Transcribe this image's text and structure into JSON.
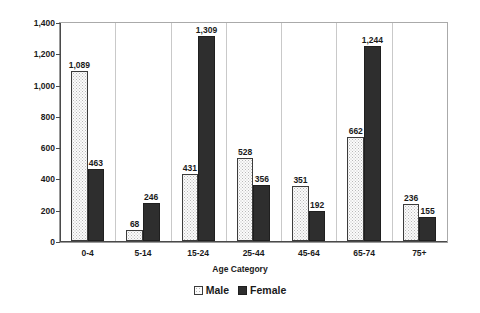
{
  "chart_data": {
    "type": "bar",
    "title": "",
    "xlabel": "Age Category",
    "ylabel": "Rate (per 100,000)",
    "categories": [
      "0-4",
      "5-14",
      "15-24",
      "25-44",
      "45-64",
      "65-74",
      "75+"
    ],
    "series": [
      {
        "name": "Male",
        "values": [
          1089,
          68,
          431,
          528,
          351,
          662,
          236
        ]
      },
      {
        "name": "Female",
        "values": [
          463,
          246,
          1309,
          356,
          192,
          1244,
          155
        ]
      }
    ],
    "value_labels": {
      "Male": [
        "1,089",
        "68",
        "431",
        "528",
        "351",
        "662",
        "236"
      ],
      "Female": [
        "463",
        "246",
        "1,309",
        "356",
        "192",
        "1,244",
        "155"
      ]
    },
    "ylim": [
      0,
      1400
    ],
    "yticks": [
      0,
      200,
      400,
      600,
      800,
      1000,
      1200,
      1400
    ],
    "ytick_labels": [
      "0",
      "200",
      "400",
      "600",
      "800",
      "1,000",
      "1,200",
      "1,400"
    ],
    "grid": false,
    "legend_position": "bottom",
    "colors": {
      "male_fill": "#fbfbfb",
      "male_border": "#3b3b3b",
      "female_fill": "#2e2e2e",
      "female_border": "#1f1f1f",
      "axis": "#4a4a4a",
      "frame": "#aaaaaa",
      "separator": "#c9c9c9",
      "text": "#1a1a1a"
    }
  },
  "legend": {
    "items": [
      {
        "label": "Male",
        "swatch": "male-swatch-icon"
      },
      {
        "label": "Female",
        "swatch": "female-swatch-icon"
      }
    ]
  }
}
